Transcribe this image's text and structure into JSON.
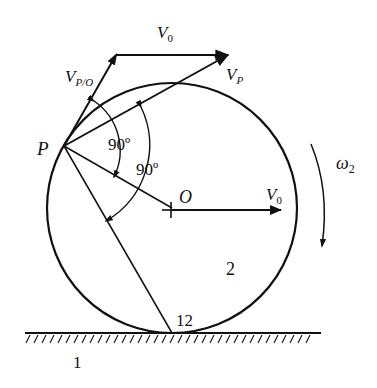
{
  "diagram": {
    "type": "kinematics-rolling-wheel",
    "colors": {
      "stroke": "#111111",
      "background": "#ffffff"
    },
    "labels": {
      "v0_top": "V",
      "v0_top_sub": "0",
      "vpo": "V",
      "vpo_sub": "P/O",
      "vp": "V",
      "vp_sub": "P",
      "point_p": "P",
      "angle_1": "90º",
      "angle_2": "90º",
      "center_o": "O",
      "v0_center": "V",
      "v0_center_sub": "0",
      "omega": "ω",
      "omega_sub": "2",
      "body_wheel": "2",
      "contact_point": "12",
      "body_ground": "1"
    },
    "geometry": {
      "circle": {
        "cx": 172,
        "cy": 208,
        "r": 125
      },
      "point_p": {
        "x": 64,
        "y": 146
      },
      "contact": {
        "x": 172,
        "y": 333
      },
      "ground_y": 333
    }
  }
}
